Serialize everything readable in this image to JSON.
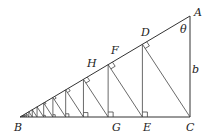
{
  "diagram": {
    "type": "geometry",
    "points": {
      "A": {
        "label": "A",
        "x": 190,
        "y": 16
      },
      "B": {
        "label": "B",
        "x": 20,
        "y": 117
      },
      "C": {
        "label": "C",
        "x": 190,
        "y": 117
      },
      "D": {
        "label": "D",
        "x": 147,
        "y": 40.5
      },
      "E": {
        "label": "E",
        "x": 147,
        "y": 117
      },
      "F": {
        "label": "F",
        "x": 116,
        "y": 58.5
      },
      "G": {
        "label": "G",
        "x": 116,
        "y": 117
      },
      "H": {
        "label": "H",
        "x": 93,
        "y": 71.5
      }
    },
    "labels": {
      "A": "A",
      "B": "B",
      "C": "C",
      "D": "D",
      "E": "E",
      "F": "F",
      "G": "G",
      "H": "H",
      "theta": "θ",
      "b": "b"
    },
    "ratio": 0.72,
    "colors": {
      "stroke": "#333333",
      "background": "#ffffff",
      "text": "#222222"
    }
  }
}
